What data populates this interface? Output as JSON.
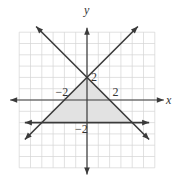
{
  "chart_data": {
    "type": "line",
    "title": "",
    "xlabel": "x",
    "ylabel": "y",
    "xlim": [
      -6,
      6
    ],
    "ylim": [
      -6,
      6
    ],
    "grid": true,
    "tick_labels": [
      {
        "text": "-2",
        "axis": "x",
        "value": -2
      },
      {
        "text": "2",
        "axis": "x",
        "value": 2
      },
      {
        "text": "2",
        "axis": "y",
        "value": 2
      },
      {
        "text": "-2",
        "axis": "y",
        "value": -2
      }
    ],
    "series": [
      {
        "name": "y = x + 2",
        "slope": 1,
        "intercept": 2,
        "x": [
          -5.5,
          4.5
        ],
        "arrows": "both"
      },
      {
        "name": "y = -x + 2",
        "slope": -1,
        "intercept": 2,
        "x": [
          -4.5,
          5.5
        ],
        "arrows": "both"
      },
      {
        "name": "y = -2",
        "slope": 0,
        "intercept": -2,
        "x": [
          -5.5,
          5.5
        ],
        "arrows": "both"
      }
    ],
    "shaded_region": {
      "vertices": [
        [
          -4,
          -2
        ],
        [
          4,
          -2
        ],
        [
          0,
          2
        ]
      ],
      "color": "#e2e2e2"
    },
    "line_color": "#3a3a3a",
    "grid_color": "#d4d4d4"
  }
}
